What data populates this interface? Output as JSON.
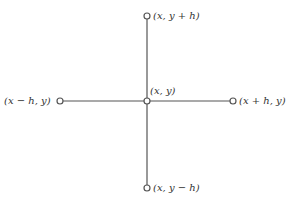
{
  "diagram": {
    "type": "five-point stencil",
    "stroke_color": "#555555",
    "nodes": [
      {
        "id": "top",
        "label": "(x, y + h)"
      },
      {
        "id": "left",
        "label": "(x − h, y)"
      },
      {
        "id": "center",
        "label": "(x, y)"
      },
      {
        "id": "right",
        "label": "(x + h, y)"
      },
      {
        "id": "bottom",
        "label": "(x, y − h)"
      }
    ]
  }
}
